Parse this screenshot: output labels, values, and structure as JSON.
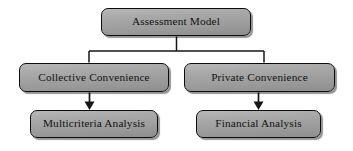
{
  "diagram": {
    "type": "flowchart-tree",
    "colors": {
      "node_fill_light": "#b8b8b8",
      "node_fill_dark": "#8e8e8e",
      "node_border": "#0d0d0d",
      "edge": "#161616",
      "text": "#121212",
      "background": "#ffffff"
    },
    "nodes": {
      "root": {
        "id": "root",
        "label": "Assessment Model",
        "level": 1
      },
      "collective": {
        "id": "collective",
        "label": "Collective Convenience",
        "level": 2
      },
      "private": {
        "id": "private",
        "label": "Private Convenience",
        "level": 2
      },
      "multicriteria": {
        "id": "multicriteria",
        "label": "Multicriteria Analysis",
        "level": 3
      },
      "financial": {
        "id": "financial",
        "label": "Financial Analysis",
        "level": 3
      }
    },
    "edges": [
      {
        "from": "root",
        "to": "collective",
        "style": "elbow",
        "arrowhead": "none"
      },
      {
        "from": "root",
        "to": "private",
        "style": "elbow",
        "arrowhead": "none"
      },
      {
        "from": "collective",
        "to": "multicriteria",
        "style": "straight",
        "arrowhead": "filled-triangle"
      },
      {
        "from": "private",
        "to": "financial",
        "style": "straight",
        "arrowhead": "filled-triangle"
      }
    ]
  }
}
